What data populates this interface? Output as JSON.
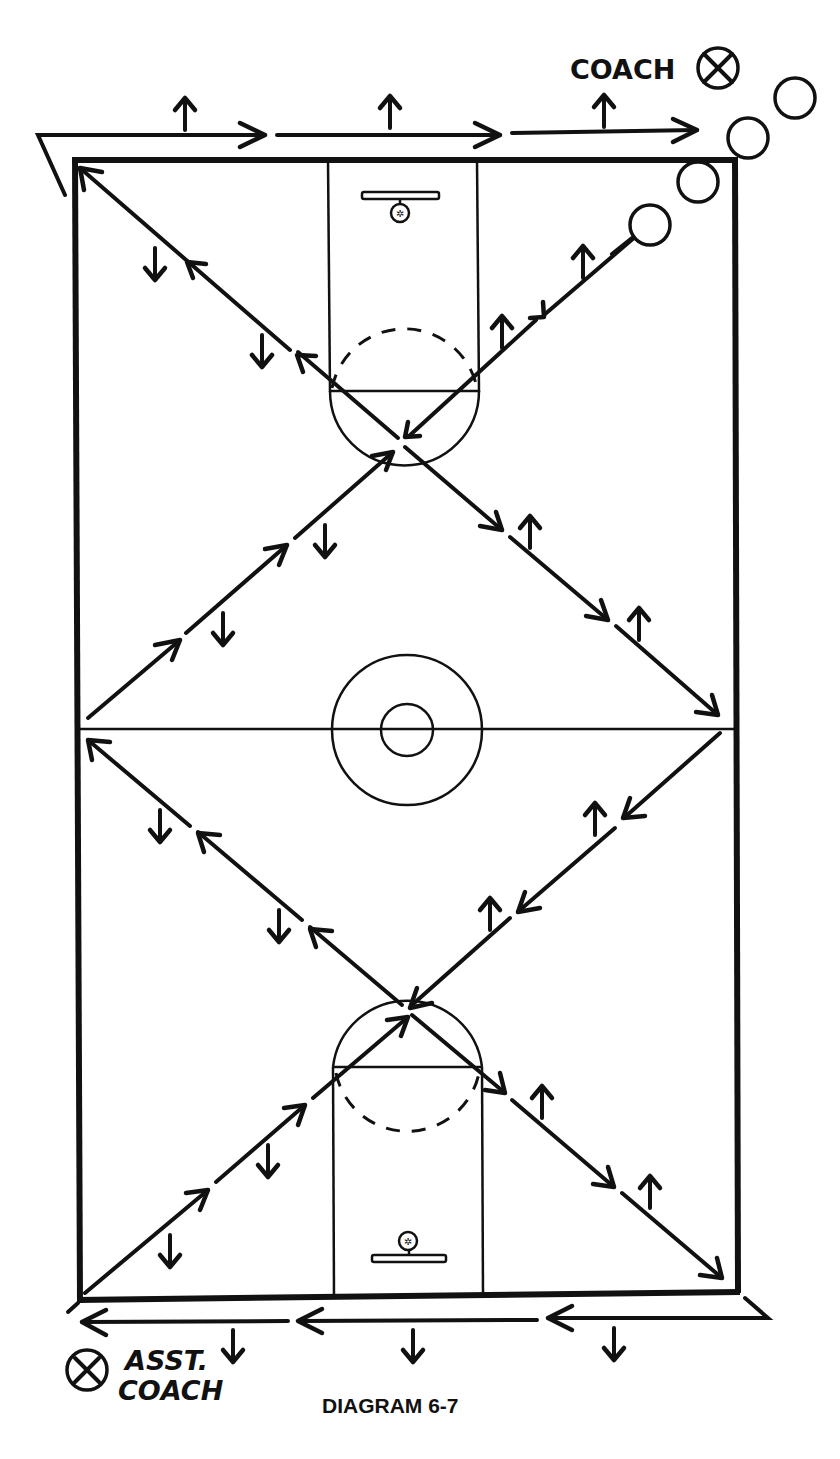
{
  "labels": {
    "coach": "COACH",
    "asst_coach_line1": "ASST.",
    "asst_coach_line2": "COACH",
    "caption": "DIAGRAM 6-7"
  },
  "court": {
    "left": 75,
    "top": 160,
    "right": 735,
    "bottom": 1300,
    "midline_y": 730,
    "center_circle": {
      "cx": 407,
      "cy": 730,
      "r_outer": 75,
      "r_inner": 26
    },
    "top_lane": {
      "x1": 330,
      "x2": 478,
      "ft_y": 392
    },
    "bottom_lane": {
      "x1": 333,
      "x2": 483,
      "ft_y": 1067
    }
  },
  "players": {
    "count": 4,
    "positions": [
      [
        650,
        225
      ],
      [
        697,
        182
      ],
      [
        745,
        138
      ],
      [
        795,
        100
      ]
    ]
  },
  "drill": {
    "description": "Players run diagonal paths across the court with sideline and baseline runs; coach at top right, assistant coach at bottom left.",
    "direction_markers": "small arrows indicate facing direction"
  },
  "colors": {
    "ink": "#111111",
    "paper": "#ffffff"
  }
}
